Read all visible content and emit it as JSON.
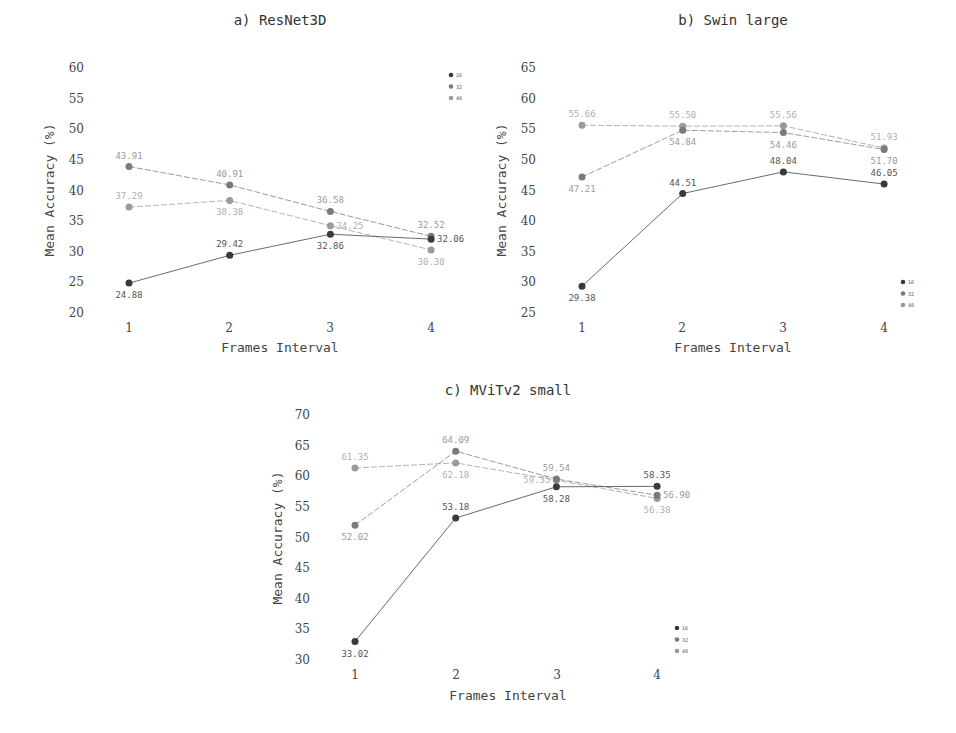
{
  "chart_data": [
    {
      "type": "line",
      "title": "a) ResNet3D",
      "xlabel": "Frames Interval",
      "ylabel": "Mean Accuracy (%)",
      "categories": [
        "1",
        "2",
        "3",
        "4"
      ],
      "yticks": [
        "20",
        "25",
        "30",
        "35",
        "40",
        "45",
        "50",
        "55",
        "60"
      ],
      "ylim": [
        20,
        60
      ],
      "legend_position": "upper right",
      "grid": false,
      "series": [
        {
          "name": "16",
          "values": [
            24.88,
            29.42,
            32.86,
            32.06
          ],
          "labels": [
            "24.88",
            "29.42",
            "32.86",
            "32.06"
          ]
        },
        {
          "name": "32",
          "values": [
            43.91,
            40.91,
            36.58,
            32.52
          ],
          "labels": [
            "43.91",
            "40.91",
            "36.58",
            "32.52"
          ]
        },
        {
          "name": "48",
          "values": [
            37.29,
            38.38,
            34.25,
            30.3
          ],
          "labels": [
            "37.29",
            "38.38",
            "34.25",
            "30.30"
          ]
        }
      ]
    },
    {
      "type": "line",
      "title": "b) Swin large",
      "xlabel": "Frames Interval",
      "ylabel": "Mean Accuracy (%)",
      "categories": [
        "1",
        "2",
        "3",
        "4"
      ],
      "yticks": [
        "25",
        "30",
        "35",
        "40",
        "45",
        "50",
        "55",
        "60",
        "65"
      ],
      "ylim": [
        25,
        65
      ],
      "legend_position": "lower right",
      "grid": false,
      "series": [
        {
          "name": "16",
          "values": [
            29.38,
            44.51,
            48.04,
            46.05
          ],
          "labels": [
            "29.38",
            "44.51",
            "48.04",
            "46.05"
          ]
        },
        {
          "name": "32",
          "values": [
            47.21,
            54.84,
            54.46,
            51.7
          ],
          "labels": [
            "47.21",
            "54.84",
            "54.46",
            "51.70"
          ]
        },
        {
          "name": "48",
          "values": [
            55.66,
            55.5,
            55.56,
            51.93
          ],
          "labels": [
            "55.66",
            "55.50",
            "55.56",
            "51.93"
          ]
        }
      ]
    },
    {
      "type": "line",
      "title": "c) MViTv2 small",
      "xlabel": "Frames Interval",
      "ylabel": "Mean Accuracy (%)",
      "categories": [
        "1",
        "2",
        "3",
        "4"
      ],
      "yticks": [
        "30",
        "35",
        "40",
        "45",
        "50",
        "55",
        "60",
        "65",
        "70"
      ],
      "ylim": [
        30,
        70
      ],
      "legend_position": "lower right",
      "grid": false,
      "series": [
        {
          "name": "16",
          "values": [
            33.02,
            53.18,
            58.28,
            58.35
          ],
          "labels": [
            "33.02",
            "53.18",
            "58.28",
            "58.35"
          ]
        },
        {
          "name": "32",
          "values": [
            52.02,
            64.09,
            59.54,
            56.9
          ],
          "labels": [
            "52.02",
            "64.09",
            "59.54",
            "56.90"
          ]
        },
        {
          "name": "48",
          "values": [
            61.35,
            62.18,
            59.35,
            56.38
          ],
          "labels": [
            "61.35",
            "62.18",
            "59.35",
            "56.38"
          ]
        }
      ]
    }
  ],
  "colors": {
    "16": "#3a3a3a",
    "32": "#7a7a7a",
    "48": "#9a9a9a",
    "label16": "#555555",
    "label32": "#9a9a9a",
    "label48": "#b0b0b0"
  },
  "legend": [
    "16",
    "32",
    "48"
  ]
}
